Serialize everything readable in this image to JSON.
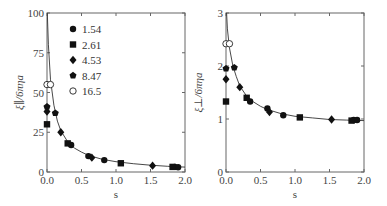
{
  "chart_data": [
    {
      "type": "scatter",
      "title": "",
      "xlabel": "s",
      "ylabel": "ξ∥/6πηa",
      "xlim": [
        0,
        2
      ],
      "ylim": [
        0,
        100
      ],
      "xticks": [
        "0.0",
        "0.5",
        "1.0",
        "1.5",
        "2.0"
      ],
      "yticks": [
        "0",
        "25",
        "50",
        "75",
        "100"
      ],
      "grid": false,
      "legend_position": "upper-left-inside",
      "series": [
        {
          "name": "1.54",
          "marker": "filled-circle",
          "points": [
            [
              0.35,
              17
            ],
            [
              0.6,
              10
            ],
            [
              0.83,
              7.5
            ],
            [
              1.85,
              3.2
            ],
            [
              1.9,
              3.0
            ]
          ]
        },
        {
          "name": "2.61",
          "marker": "filled-square",
          "points": [
            [
              0.0,
              30
            ],
            [
              0.3,
              18
            ],
            [
              1.07,
              5.5
            ],
            [
              1.82,
              3.2
            ]
          ]
        },
        {
          "name": "4.53",
          "marker": "filled-diamond",
          "points": [
            [
              0.0,
              38
            ],
            [
              0.2,
              25
            ],
            [
              0.65,
              9
            ],
            [
              1.53,
              4
            ]
          ]
        },
        {
          "name": "8.47",
          "marker": "filled-pentagon",
          "points": [
            [
              0.0,
              41
            ],
            [
              0.12,
              37
            ]
          ]
        },
        {
          "name": "16.5",
          "marker": "open-circle",
          "points": [
            [
              0.0,
              55
            ],
            [
              0.05,
              55
            ]
          ]
        }
      ],
      "fit_curve": [
        [
          0.005,
          100
        ],
        [
          0.02,
          80
        ],
        [
          0.05,
          58
        ],
        [
          0.1,
          42
        ],
        [
          0.15,
          32
        ],
        [
          0.2,
          26
        ],
        [
          0.3,
          19
        ],
        [
          0.4,
          15
        ],
        [
          0.5,
          12.5
        ],
        [
          0.6,
          10.5
        ],
        [
          0.8,
          8
        ],
        [
          1.0,
          6.5
        ],
        [
          1.25,
          5.2
        ],
        [
          1.5,
          4.3
        ],
        [
          1.75,
          3.6
        ],
        [
          2.0,
          3.1
        ]
      ]
    },
    {
      "type": "scatter",
      "title": "",
      "xlabel": "s",
      "ylabel": "ξ⊥/6πηa",
      "xlim": [
        0,
        2
      ],
      "ylim": [
        0,
        3
      ],
      "xticks": [
        "0.0",
        "0.5",
        "1.0",
        "1.5",
        "2.0"
      ],
      "yticks": [
        "0",
        "1",
        "2",
        "3"
      ],
      "grid": false,
      "series": [
        {
          "name": "1.54",
          "marker": "filled-circle",
          "points": [
            [
              0.35,
              1.33
            ],
            [
              0.6,
              1.2
            ],
            [
              0.83,
              1.07
            ],
            [
              1.85,
              0.98
            ],
            [
              1.9,
              0.98
            ]
          ]
        },
        {
          "name": "2.61",
          "marker": "filled-square",
          "points": [
            [
              0.0,
              1.33
            ],
            [
              0.3,
              1.4
            ],
            [
              1.07,
              1.03
            ],
            [
              1.82,
              0.97
            ]
          ]
        },
        {
          "name": "4.53",
          "marker": "filled-diamond",
          "points": [
            [
              0.0,
              1.75
            ],
            [
              0.2,
              1.6
            ],
            [
              0.63,
              1.13
            ],
            [
              1.53,
              0.99
            ]
          ]
        },
        {
          "name": "8.47",
          "marker": "filled-pentagon",
          "points": [
            [
              0.0,
              1.95
            ],
            [
              0.12,
              1.97
            ]
          ]
        },
        {
          "name": "16.5",
          "marker": "open-circle",
          "points": [
            [
              0.0,
              2.42
            ],
            [
              0.05,
              2.42
            ]
          ]
        }
      ],
      "fit_curve": [
        [
          0.008,
          3.0
        ],
        [
          0.02,
          2.7
        ],
        [
          0.05,
          2.35
        ],
        [
          0.1,
          2.0
        ],
        [
          0.15,
          1.8
        ],
        [
          0.2,
          1.62
        ],
        [
          0.3,
          1.43
        ],
        [
          0.4,
          1.32
        ],
        [
          0.5,
          1.24
        ],
        [
          0.6,
          1.18
        ],
        [
          0.8,
          1.1
        ],
        [
          1.0,
          1.05
        ],
        [
          1.25,
          1.02
        ],
        [
          1.5,
          0.99
        ],
        [
          1.75,
          0.98
        ],
        [
          2.0,
          0.97
        ]
      ]
    }
  ]
}
